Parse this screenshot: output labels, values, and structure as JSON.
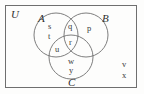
{
  "diagram": {
    "type": "venn-3-set",
    "universe": {
      "label": "U",
      "description": "universal set rectangle"
    },
    "sets": [
      {
        "id": "A",
        "label": "A",
        "position": "top-left"
      },
      {
        "id": "B",
        "label": "B",
        "position": "top-right"
      },
      {
        "id": "C",
        "label": "C",
        "position": "bottom-center"
      }
    ],
    "elements": [
      {
        "text": "s",
        "region": "A-only"
      },
      {
        "text": "t",
        "region": "A-only"
      },
      {
        "text": "q",
        "region": "A-and-B"
      },
      {
        "text": "p",
        "region": "B-only"
      },
      {
        "text": "u",
        "region": "A-and-C"
      },
      {
        "text": "r",
        "region": "A-and-B-and-C"
      },
      {
        "text": "w",
        "region": "C-only"
      },
      {
        "text": "y",
        "region": "C-only"
      }
    ],
    "outside_elements": [
      {
        "text": "v",
        "region": "outside-all-sets"
      },
      {
        "text": "x",
        "region": "outside-all-sets"
      }
    ],
    "colors": {
      "stroke": "#6f6f6f",
      "text": "#3a3a3a",
      "background": "#fdfdfc"
    }
  }
}
